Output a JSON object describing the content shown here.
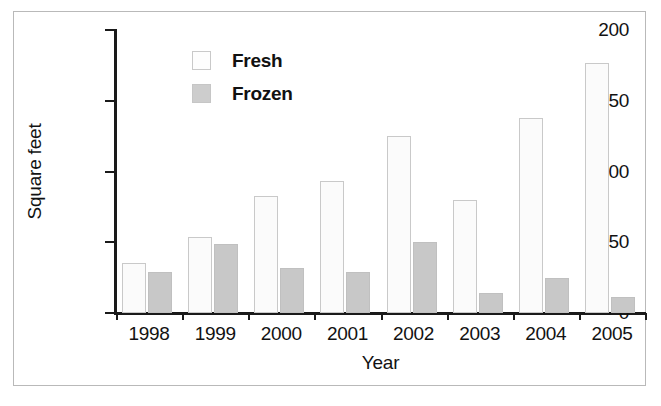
{
  "chart_data": {
    "type": "bar",
    "title": "",
    "xlabel": "Year",
    "ylabel": "Square feet",
    "categories": [
      "1998",
      "1999",
      "2000",
      "2001",
      "2002",
      "2003",
      "2004",
      "2005"
    ],
    "series": [
      {
        "name": "Fresh",
        "values": [
          35,
          54,
          83,
          93,
          125,
          80,
          138,
          177
        ]
      },
      {
        "name": "Frozen",
        "values": [
          29,
          49,
          32,
          29,
          50,
          14,
          25,
          11
        ]
      }
    ],
    "ylim": [
      0,
      200
    ],
    "yticks": [
      0,
      50,
      100,
      150,
      200
    ],
    "ytick_labels": [
      "0",
      "50",
      "100",
      "150",
      "200"
    ],
    "grid": false,
    "legend_position": "upper-center-left",
    "colors": {
      "fresh_fill": "#fbfbfb",
      "fresh_edge": "#c9c9c9",
      "frozen_fill": "#c8c8c8",
      "frozen_edge": "#c0c0c0",
      "axis": "#1a1a1a",
      "text": "#121212",
      "frame": "#b9b9b9",
      "background": "#ffffff"
    }
  },
  "legend": {
    "items": [
      {
        "label": "Fresh",
        "swatch": "fresh-swatch-icon"
      },
      {
        "label": "Frozen",
        "swatch": "frozen-swatch-icon"
      }
    ]
  },
  "axes": {
    "y_title": "Square feet",
    "x_title": "Year"
  }
}
